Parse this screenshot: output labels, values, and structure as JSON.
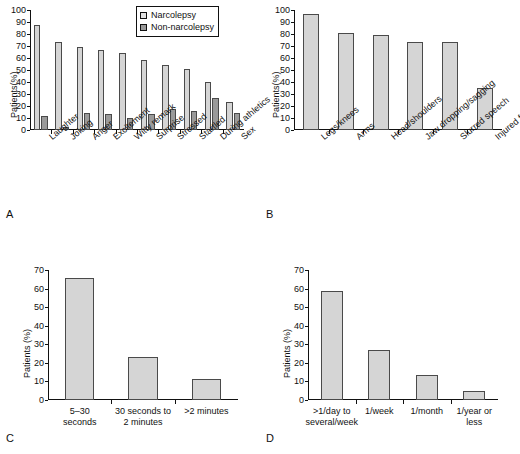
{
  "figure": {
    "panel_letters": [
      "A",
      "B",
      "C",
      "D"
    ]
  },
  "chart_data": [
    {
      "panel": "A",
      "type": "bar",
      "title": "",
      "xlabel": "",
      "ylabel": "Patients(%)",
      "ylim": [
        0,
        100
      ],
      "yticks": [
        0,
        10,
        20,
        30,
        40,
        50,
        60,
        70,
        80,
        90,
        100
      ],
      "grid": false,
      "legend_position": "top-right",
      "categories": [
        "Laughter",
        "Joking",
        "Anger",
        "Excitement",
        "Witty remark",
        "Surprise",
        "Stressed",
        "Startled",
        "During athletics",
        "Sex"
      ],
      "series": [
        {
          "name": "Narcolepsy",
          "color": "#d5d5d5",
          "values": [
            87.5,
            73,
            69,
            66.5,
            64.5,
            58.5,
            54.5,
            50.5,
            40,
            23
          ]
        },
        {
          "name": "Non-narcolepsy",
          "color": "#9a9a9a",
          "values": [
            11.5,
            2.5,
            14,
            13.5,
            10,
            13.5,
            17.5,
            15.5,
            26.5,
            14.5
          ]
        }
      ]
    },
    {
      "panel": "B",
      "type": "bar",
      "title": "",
      "xlabel": "",
      "ylabel": "Patients(%)",
      "ylim": [
        0,
        100
      ],
      "yticks": [
        0,
        10,
        20,
        30,
        40,
        50,
        60,
        70,
        80,
        90,
        100
      ],
      "grid": false,
      "categories": [
        "Legs/knees",
        "Arms",
        "Head/shoulders",
        "Jaw dropping/sagging",
        "Slurred speech",
        "Injured from weakness"
      ],
      "values": [
        97,
        81,
        79,
        73,
        73,
        35
      ],
      "color": "#d5d5d5"
    },
    {
      "panel": "C",
      "type": "bar",
      "title": "",
      "xlabel": "",
      "ylabel": "Patients (%)",
      "ylim": [
        0,
        70
      ],
      "yticks": [
        0,
        10,
        20,
        30,
        40,
        50,
        60,
        70
      ],
      "grid": false,
      "categories": [
        "5–30 seconds",
        "30 seconds to 2 minutes",
        ">2 minutes"
      ],
      "category_lines": [
        [
          "5–30",
          "seconds"
        ],
        [
          "30 seconds to",
          "2 minutes"
        ],
        [
          ">2 minutes",
          ""
        ]
      ],
      "values": [
        65.5,
        23,
        11.5
      ],
      "color": "#d5d5d5"
    },
    {
      "panel": "D",
      "type": "bar",
      "title": "",
      "xlabel": "",
      "ylabel": "Patients (%)",
      "ylim": [
        0,
        70
      ],
      "yticks": [
        0,
        10,
        20,
        30,
        40,
        50,
        60,
        70
      ],
      "grid": false,
      "categories": [
        ">1/day to several/week",
        "1/week",
        "1/month",
        "1/year or less"
      ],
      "category_lines": [
        [
          ">1/day to",
          "several/week"
        ],
        [
          "1/week",
          ""
        ],
        [
          "1/month",
          ""
        ],
        [
          "1/year or",
          "less"
        ]
      ],
      "values": [
        58.5,
        27,
        13.5,
        5
      ],
      "color": "#d5d5d5"
    }
  ]
}
